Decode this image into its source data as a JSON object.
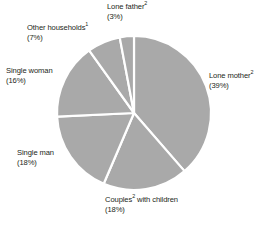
{
  "chart_data": {
    "type": "pie",
    "title": "",
    "subtitle": "",
    "xlabel": "",
    "ylabel": "",
    "legend_position": "none",
    "grid": false,
    "start_angle_deg": 0,
    "direction": "clockwise",
    "units": "percent",
    "categories": [
      "Lone mother",
      "Couples with children",
      "Single man",
      "Single woman",
      "Other households",
      "Lone father"
    ],
    "values": [
      39,
      18,
      18,
      16,
      7,
      3
    ],
    "slice_color": "#a9a9a9",
    "divider_color": "#ffffff",
    "slices": [
      {
        "id": "lone-mother",
        "name": "Lone mother",
        "footnote": "2",
        "value": 39,
        "value_text": "(39%)",
        "label_text": "Lone mother",
        "color": "#a9a9a9"
      },
      {
        "id": "couples-with-children",
        "name": "Couples with children",
        "footnote": "2",
        "value": 18,
        "value_text": "(18%)",
        "label_text_before": "Couples",
        "label_text_after": " with children",
        "color": "#a9a9a9"
      },
      {
        "id": "single-man",
        "name": "Single man",
        "footnote": "",
        "value": 18,
        "value_text": "(18%)",
        "label_text": "Single man",
        "color": "#a9a9a9"
      },
      {
        "id": "single-woman",
        "name": "Single woman",
        "footnote": "",
        "value": 16,
        "value_text": "(16%)",
        "label_text": "Single woman",
        "color": "#a9a9a9"
      },
      {
        "id": "other-households",
        "name": "Other households",
        "footnote": "1",
        "value": 7,
        "value_text": "(7%)",
        "label_text": "Other households",
        "color": "#a9a9a9"
      },
      {
        "id": "lone-father",
        "name": "Lone father",
        "footnote": "2",
        "value": 3,
        "value_text": "(3%)",
        "label_text": "Lone father",
        "color": "#a9a9a9"
      }
    ]
  },
  "labels": {
    "lone_father": {
      "name": "Lone father",
      "sup": "2",
      "value": "(3%)"
    },
    "other_households": {
      "name": "Other households",
      "sup": "1",
      "value": "(7%)"
    },
    "single_woman": {
      "name": "Single woman",
      "sup": "",
      "value": "(16%)"
    },
    "single_man": {
      "name": "Single man",
      "sup": "",
      "value": "(18%)"
    },
    "couples": {
      "name_before": "Couples",
      "sup": "2",
      "name_after": " with children",
      "value": "(18%)"
    },
    "lone_mother": {
      "name": "Lone mother",
      "sup": "2",
      "value": "(39%)"
    }
  },
  "colors": {
    "slice": "#a9a9a9",
    "divider": "#ffffff",
    "text": "#231f20",
    "background": "#ffffff"
  }
}
